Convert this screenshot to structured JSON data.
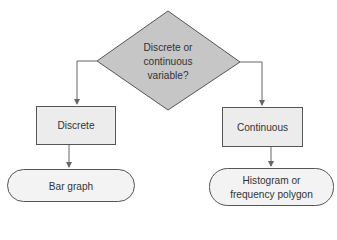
{
  "diagram": {
    "type": "flowchart",
    "colors": {
      "decision_fill": "#c6c6c6",
      "process_fill": "#ececec",
      "terminal_fill": "#f3f3f3",
      "stroke": "#555555",
      "connector": "#666666"
    },
    "decision": {
      "label_line1": "Discrete or",
      "label_line2": "continuous",
      "label_line3": "variable?"
    },
    "left_branch": {
      "process_label": "Discrete",
      "terminal_label": "Bar graph"
    },
    "right_branch": {
      "process_label": "Continuous",
      "terminal_label_line1": "Histogram or",
      "terminal_label_line2": "frequency polygon"
    }
  }
}
